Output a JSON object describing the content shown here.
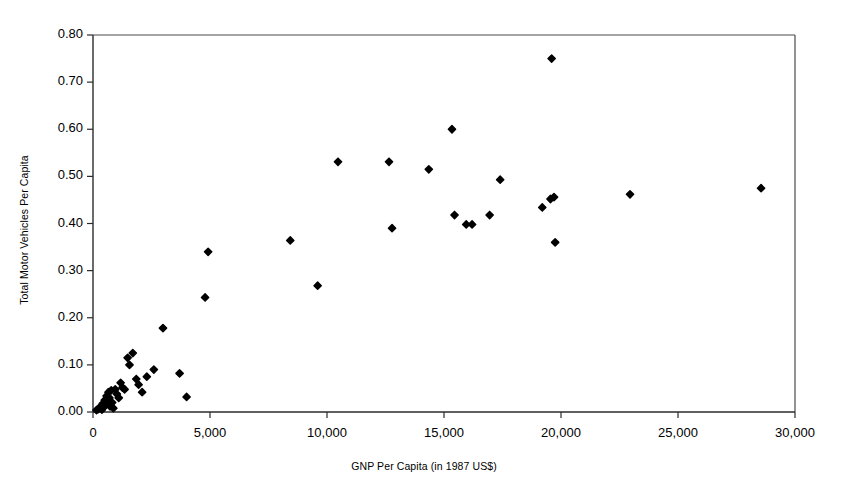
{
  "chart_data": {
    "type": "scatter",
    "title": "",
    "xlabel": "GNP Per Capita (in 1987 US$)",
    "ylabel": "Total Motor Vehicles Per Capita",
    "xlim": [
      0,
      30000
    ],
    "ylim": [
      0.0,
      0.8
    ],
    "xticks": [
      0,
      5000,
      10000,
      15000,
      20000,
      25000,
      30000
    ],
    "xticklabels": [
      "0",
      "5,000",
      "10,000",
      "15,000",
      "20,000",
      "25,000",
      "30,000"
    ],
    "yticks": [
      0.0,
      0.1,
      0.2,
      0.3,
      0.4,
      0.5,
      0.6,
      0.7,
      0.8
    ],
    "yticklabels": [
      "0.00",
      "0.10",
      "0.20",
      "0.30",
      "0.40",
      "0.50",
      "0.60",
      "0.70",
      "0.80"
    ],
    "grid": false,
    "legend": false,
    "marker": "diamond",
    "marker_color": "#000000",
    "marker_size": 5,
    "series": [
      {
        "name": "Countries",
        "points": [
          [
            150,
            0.004
          ],
          [
            220,
            0.006
          ],
          [
            300,
            0.008
          ],
          [
            330,
            0.012
          ],
          [
            380,
            0.005
          ],
          [
            420,
            0.018
          ],
          [
            450,
            0.01
          ],
          [
            500,
            0.025
          ],
          [
            540,
            0.015
          ],
          [
            580,
            0.034
          ],
          [
            620,
            0.022
          ],
          [
            660,
            0.042
          ],
          [
            700,
            0.03
          ],
          [
            730,
            0.012
          ],
          [
            780,
            0.046
          ],
          [
            820,
            0.02
          ],
          [
            870,
            0.008
          ],
          [
            950,
            0.048
          ],
          [
            1020,
            0.038
          ],
          [
            1100,
            0.03
          ],
          [
            1180,
            0.062
          ],
          [
            1260,
            0.052
          ],
          [
            1350,
            0.048
          ],
          [
            1480,
            0.115
          ],
          [
            1560,
            0.1
          ],
          [
            1700,
            0.125
          ],
          [
            1850,
            0.07
          ],
          [
            1950,
            0.058
          ],
          [
            2100,
            0.042
          ],
          [
            2300,
            0.075
          ],
          [
            2600,
            0.09
          ],
          [
            2990,
            0.178
          ],
          [
            3700,
            0.082
          ],
          [
            4000,
            0.032
          ],
          [
            4920,
            0.34
          ],
          [
            4790,
            0.243
          ],
          [
            8430,
            0.364
          ],
          [
            9600,
            0.268
          ],
          [
            10470,
            0.531
          ],
          [
            12650,
            0.531
          ],
          [
            12780,
            0.39
          ],
          [
            14350,
            0.515
          ],
          [
            15340,
            0.6
          ],
          [
            15450,
            0.418
          ],
          [
            15950,
            0.398
          ],
          [
            16200,
            0.398
          ],
          [
            16950,
            0.418
          ],
          [
            17400,
            0.493
          ],
          [
            19200,
            0.434
          ],
          [
            19550,
            0.452
          ],
          [
            19700,
            0.456
          ],
          [
            19600,
            0.75
          ],
          [
            19750,
            0.36
          ],
          [
            22950,
            0.462
          ],
          [
            28550,
            0.475
          ]
        ]
      }
    ]
  },
  "axes": {
    "x_title": "GNP Per Capita (in 1987 US$)",
    "y_title": "Total Motor Vehicles Per Capita"
  }
}
